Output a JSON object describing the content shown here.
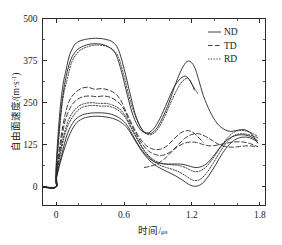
{
  "chart_data": {
    "type": "line",
    "title": "",
    "xlabel": "时间/μs",
    "ylabel": "自由面速度/(m·s⁻¹)",
    "ylabel_main": "自由面速度/(m",
    "ylabel_mid": "·s",
    "ylabel_sup": "-1",
    "ylabel_end": ")",
    "xlabel_main": "时间/",
    "xlabel_unit": "μs",
    "xlim": [
      -0.12,
      1.85
    ],
    "ylim": [
      -55,
      500
    ],
    "x_ticks": [
      0,
      0.6,
      1.2,
      1.8
    ],
    "x_tick_labels": [
      "0",
      "0.6",
      "1.2",
      "1.8"
    ],
    "x_minor_ticks": [
      0.2,
      0.4,
      0.8,
      1.0,
      1.4,
      1.6
    ],
    "y_ticks": [
      0,
      125,
      250,
      375,
      500
    ],
    "y_tick_labels": [
      "0",
      "125",
      "250",
      "375",
      "500"
    ],
    "y_minor_ticks": [
      62.5,
      187.5,
      312.5,
      437.5
    ],
    "grid": false,
    "legend_position": "top-right",
    "legend": [
      {
        "label": "ND",
        "style": "solid"
      },
      {
        "label": "TD",
        "style": "dashed"
      },
      {
        "label": "RD",
        "style": "dotted"
      }
    ],
    "series": [
      {
        "name": "ND-high",
        "style": "solid",
        "x": [
          -0.12,
          0.0,
          0.0,
          0.03,
          0.06,
          0.09,
          0.12,
          0.16,
          0.2,
          0.26,
          0.32,
          0.38,
          0.44,
          0.5,
          0.55,
          0.6,
          0.65,
          0.7,
          0.76,
          0.82,
          0.88,
          0.94,
          1.0,
          1.06,
          1.12,
          1.17,
          1.22,
          1.26,
          1.3,
          1.36,
          1.42,
          1.48,
          1.54,
          1.6,
          1.66,
          1.72,
          1.78
        ],
        "y": [
          0,
          0,
          60,
          210,
          300,
          350,
          392,
          420,
          432,
          438,
          441,
          441,
          438,
          430,
          408,
          352,
          282,
          215,
          170,
          158,
          170,
          205,
          252,
          310,
          356,
          374,
          358,
          318,
          272,
          224,
          190,
          172,
          165,
          168,
          170,
          160,
          130
        ]
      },
      {
        "name": "ND-high-2",
        "style": "solid",
        "x": [
          -0.12,
          0.0,
          0.0,
          0.03,
          0.06,
          0.09,
          0.13,
          0.18,
          0.24,
          0.3,
          0.36,
          0.42,
          0.48,
          0.53,
          0.58,
          0.63,
          0.68,
          0.74,
          0.8,
          0.86,
          0.92,
          0.98,
          1.04,
          1.1,
          1.15,
          1.2,
          1.22
        ],
        "y": [
          0,
          0,
          45,
          180,
          272,
          330,
          378,
          405,
          418,
          424,
          425,
          422,
          412,
          392,
          340,
          272,
          212,
          172,
          160,
          172,
          205,
          250,
          295,
          322,
          328,
          305,
          288
        ]
      },
      {
        "name": "RD-high",
        "style": "dotted",
        "x": [
          -0.12,
          0.0,
          0.0,
          0.03,
          0.06,
          0.1,
          0.14,
          0.2,
          0.26,
          0.32,
          0.38,
          0.44,
          0.5,
          0.55,
          0.6,
          0.65,
          0.71,
          0.77,
          0.83,
          0.89,
          0.95,
          1.01,
          1.07,
          1.12,
          1.17,
          1.21,
          1.25
        ],
        "y": [
          0,
          0,
          40,
          165,
          262,
          322,
          372,
          402,
          414,
          420,
          421,
          418,
          408,
          386,
          330,
          262,
          202,
          166,
          155,
          168,
          202,
          248,
          290,
          315,
          322,
          300,
          278
        ]
      },
      {
        "name": "TD-mid-upper",
        "style": "dashed",
        "x": [
          -0.12,
          0.0,
          0.0,
          0.04,
          0.08,
          0.12,
          0.17,
          0.22,
          0.28,
          0.34,
          0.4,
          0.46,
          0.52,
          0.57,
          0.62,
          0.68,
          0.74,
          0.8,
          0.86,
          0.92,
          0.98,
          1.04,
          1.1,
          1.15,
          1.2,
          1.25,
          1.3
        ],
        "y": [
          0,
          0,
          35,
          140,
          215,
          258,
          280,
          292,
          296,
          290,
          292,
          288,
          278,
          258,
          222,
          180,
          145,
          122,
          112,
          112,
          122,
          142,
          160,
          167,
          164,
          150,
          133
        ]
      },
      {
        "name": "TD-mid",
        "style": "dashed",
        "x": [
          -0.12,
          0.0,
          0.0,
          0.04,
          0.08,
          0.13,
          0.18,
          0.24,
          0.3,
          0.36,
          0.42,
          0.48,
          0.54,
          0.59,
          0.64,
          0.7,
          0.76,
          0.82,
          0.88,
          0.94,
          1.0,
          1.06,
          1.12,
          1.18,
          1.24,
          1.3,
          1.36,
          1.42,
          1.48,
          1.54,
          1.6,
          1.66,
          1.72,
          1.78
        ],
        "y": [
          0,
          0,
          30,
          122,
          196,
          238,
          258,
          268,
          270,
          268,
          270,
          266,
          254,
          236,
          202,
          162,
          128,
          106,
          96,
          94,
          102,
          116,
          128,
          133,
          132,
          126,
          122,
          124,
          128,
          132,
          134,
          133,
          128,
          120
        ]
      },
      {
        "name": "RD-mid",
        "style": "dotted",
        "x": [
          -0.12,
          0.0,
          0.0,
          0.04,
          0.09,
          0.14,
          0.2,
          0.26,
          0.32,
          0.38,
          0.44,
          0.5,
          0.56,
          0.61,
          0.66,
          0.72,
          0.78,
          0.84,
          0.9,
          0.96,
          1.02,
          1.08,
          1.14,
          1.2,
          1.26,
          1.32,
          1.38,
          1.44,
          1.5,
          1.56,
          1.62,
          1.68,
          1.74,
          1.78
        ],
        "y": [
          0,
          0,
          28,
          110,
          180,
          218,
          240,
          248,
          250,
          248,
          248,
          243,
          232,
          212,
          180,
          142,
          108,
          86,
          74,
          68,
          66,
          64,
          58,
          48,
          46,
          58,
          82,
          112,
          140,
          160,
          168,
          166,
          158,
          150
        ]
      },
      {
        "name": "RD-mid-2",
        "style": "dotted",
        "x": [
          -0.12,
          0.0,
          0.0,
          0.04,
          0.09,
          0.15,
          0.21,
          0.27,
          0.33,
          0.39,
          0.45,
          0.51,
          0.57,
          0.62,
          0.67,
          0.73,
          0.79,
          0.85,
          0.91,
          0.97,
          1.03,
          1.09,
          1.15,
          1.21,
          1.27,
          1.33,
          1.39,
          1.45,
          1.51,
          1.57,
          1.63,
          1.69,
          1.75,
          1.78
        ],
        "y": [
          0,
          0,
          25,
          100,
          170,
          210,
          232,
          240,
          242,
          240,
          240,
          235,
          222,
          202,
          170,
          134,
          102,
          80,
          66,
          58,
          52,
          44,
          32,
          20,
          22,
          42,
          72,
          105,
          134,
          152,
          158,
          156,
          150,
          146
        ]
      },
      {
        "name": "ND-low",
        "style": "solid",
        "x": [
          -0.12,
          0.0,
          0.0,
          0.05,
          0.1,
          0.16,
          0.22,
          0.28,
          0.34,
          0.4,
          0.46,
          0.52,
          0.58,
          0.63,
          0.68,
          0.74,
          0.8,
          0.86,
          0.92,
          0.98,
          1.04,
          1.1,
          1.16,
          1.22,
          1.28,
          1.34,
          1.4,
          1.46,
          1.52,
          1.58,
          1.64,
          1.7,
          1.76,
          1.78
        ],
        "y": [
          0,
          0,
          22,
          96,
          158,
          196,
          212,
          218,
          220,
          220,
          218,
          212,
          200,
          182,
          152,
          118,
          92,
          76,
          70,
          68,
          68,
          68,
          64,
          58,
          60,
          72,
          96,
          122,
          142,
          152,
          155,
          152,
          142,
          138
        ]
      },
      {
        "name": "ND-low-2",
        "style": "solid",
        "x": [
          -0.12,
          0.0,
          0.0,
          0.05,
          0.11,
          0.17,
          0.23,
          0.29,
          0.35,
          0.41,
          0.47,
          0.53,
          0.59,
          0.64,
          0.69,
          0.75,
          0.81,
          0.87,
          0.93,
          0.99,
          1.05,
          1.11,
          1.17,
          1.23,
          1.29,
          1.35,
          1.41,
          1.47,
          1.53,
          1.59,
          1.65,
          1.71,
          1.77,
          1.78
        ],
        "y": [
          0,
          0,
          20,
          88,
          148,
          186,
          202,
          208,
          210,
          209,
          206,
          200,
          188,
          170,
          142,
          110,
          84,
          66,
          54,
          44,
          34,
          22,
          8,
          2,
          10,
          34,
          66,
          100,
          126,
          142,
          148,
          146,
          136,
          132
        ]
      },
      {
        "name": "TD-low",
        "style": "dashed",
        "x": [
          0.78,
          0.84,
          0.9,
          0.96,
          1.02,
          1.08,
          1.14,
          1.2,
          1.26,
          1.32,
          1.38,
          1.44,
          1.5,
          1.56,
          1.62,
          1.68,
          1.74,
          1.78
        ],
        "y": [
          58,
          62,
          70,
          84,
          104,
          126,
          145,
          156,
          158,
          150,
          138,
          126,
          120,
          118,
          120,
          122,
          121,
          120
        ]
      }
    ]
  }
}
